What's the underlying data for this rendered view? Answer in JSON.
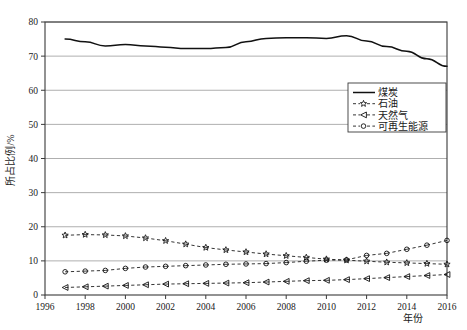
{
  "chart_data": {
    "type": "line",
    "title": "",
    "xlabel": "年份",
    "ylabel": "所占比例/%",
    "xlim": [
      1996,
      2016
    ],
    "ylim": [
      0,
      80
    ],
    "xticks": [
      1996,
      1998,
      2000,
      2002,
      2004,
      2006,
      2008,
      2010,
      2012,
      2014,
      2016
    ],
    "yticks": [
      0,
      10,
      20,
      30,
      40,
      50,
      60,
      70,
      80
    ],
    "grid": "horizontal",
    "legend_position": "center-right",
    "x": [
      1997,
      1998,
      1999,
      2000,
      2001,
      2002,
      2003,
      2004,
      2005,
      2006,
      2007,
      2008,
      2009,
      2010,
      2011,
      2012,
      2013,
      2014,
      2015,
      2016
    ],
    "series": [
      {
        "name": "煤炭",
        "marker": "none",
        "line": "solid",
        "values": [
          75.0,
          74.2,
          73.0,
          73.4,
          73.0,
          72.6,
          72.2,
          72.2,
          72.5,
          74.2,
          75.2,
          75.4,
          75.4,
          75.2,
          76.0,
          74.4,
          72.8,
          71.4,
          69.2,
          67.0
        ]
      },
      {
        "name": "石油",
        "marker": "star",
        "line": "dashed",
        "values": [
          17.5,
          17.7,
          17.6,
          17.3,
          16.7,
          15.9,
          14.9,
          13.9,
          13.2,
          12.6,
          12.0,
          11.5,
          11.0,
          10.5,
          10.2,
          9.9,
          9.6,
          9.4,
          9.2,
          9.0
        ]
      },
      {
        "name": "天然气",
        "marker": "triangle-left",
        "line": "dashed",
        "values": [
          2.2,
          2.4,
          2.6,
          2.8,
          3.0,
          3.2,
          3.3,
          3.4,
          3.5,
          3.6,
          3.8,
          4.0,
          4.2,
          4.3,
          4.5,
          4.8,
          5.1,
          5.4,
          5.7,
          6.0
        ]
      },
      {
        "name": "可再生能源",
        "marker": "circle",
        "line": "dashed",
        "values": [
          6.8,
          7.0,
          7.2,
          7.8,
          8.2,
          8.4,
          8.6,
          8.8,
          9.0,
          9.1,
          9.2,
          9.5,
          9.9,
          10.2,
          10.3,
          11.6,
          12.2,
          13.4,
          14.6,
          16.0
        ]
      }
    ]
  },
  "legend": {
    "items": [
      {
        "label": "煤炭"
      },
      {
        "label": "石油"
      },
      {
        "label": "天然气"
      },
      {
        "label": "可再生能源"
      }
    ]
  },
  "colors": {
    "line": "#111111",
    "grid": "#9a9a9a",
    "frame": "#3a3a3a",
    "background": "#ffffff"
  }
}
